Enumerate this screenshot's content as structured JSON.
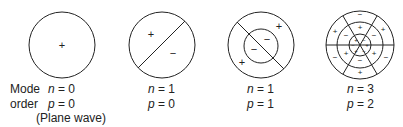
{
  "figure": {
    "row_labels": {
      "line1": "Mode",
      "line2": "order"
    },
    "modes": [
      {
        "id": "n0p0",
        "n_label": "n",
        "n_value": "= 0",
        "p_label": "p",
        "p_value": "= 0",
        "note": "(Plane wave)",
        "signs": [
          "+"
        ]
      },
      {
        "id": "n1p0",
        "n_label": "n",
        "n_value": "= 1",
        "p_label": "p",
        "p_value": "= 0",
        "signs": [
          "+",
          "−"
        ]
      },
      {
        "id": "n1p1",
        "n_label": "n",
        "n_value": "= 1",
        "p_label": "p",
        "p_value": "= 1",
        "signs": [
          "+",
          "−",
          "−",
          "+"
        ]
      },
      {
        "id": "n3p2",
        "n_label": "n",
        "n_value": "= 3",
        "p_label": "p",
        "p_value": "= 2",
        "signs": [
          "+",
          "−",
          "+",
          "−",
          "+",
          "−"
        ]
      }
    ],
    "colors": {
      "stroke": "#222222",
      "background": "#ffffff"
    }
  }
}
